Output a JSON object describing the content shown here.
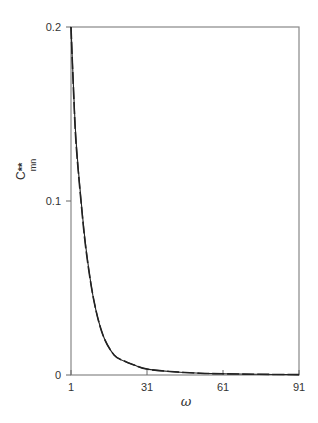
{
  "chart_data": {
    "type": "line",
    "title": "",
    "xlabel": "ω",
    "ylabel": "C**mn",
    "ylabel_main": "C",
    "ylabel_sup": "**",
    "ylabel_sub": "mn",
    "xlim": [
      1,
      91
    ],
    "ylim": [
      0,
      0.2
    ],
    "x_ticks": [
      "1",
      "31",
      "61",
      "91"
    ],
    "y_ticks": [
      "0",
      "0.1",
      "0.2"
    ],
    "grid": false,
    "legend": null,
    "series": [
      {
        "name": "solid",
        "style": "solid",
        "x": [
          1,
          2,
          3,
          5,
          7,
          10,
          13.6,
          18,
          22,
          26,
          31,
          40,
          52,
          61,
          75,
          91
        ],
        "y": [
          0.2,
          0.165,
          0.135,
          0.1,
          0.072,
          0.043,
          0.023,
          0.0115,
          0.008,
          0.0057,
          0.0034,
          0.002,
          0.001,
          0.0007,
          0.0004,
          0.0002
        ]
      },
      {
        "name": "dashed",
        "style": "dashed",
        "x": [
          1,
          2,
          3,
          5,
          7,
          10,
          13.6,
          18,
          22,
          26,
          31,
          40,
          52,
          61,
          75,
          91
        ],
        "y": [
          0.2,
          0.163,
          0.133,
          0.099,
          0.071,
          0.043,
          0.023,
          0.0115,
          0.008,
          0.0057,
          0.0034,
          0.002,
          0.001,
          0.0007,
          0.0004,
          0.0002
        ]
      }
    ]
  }
}
